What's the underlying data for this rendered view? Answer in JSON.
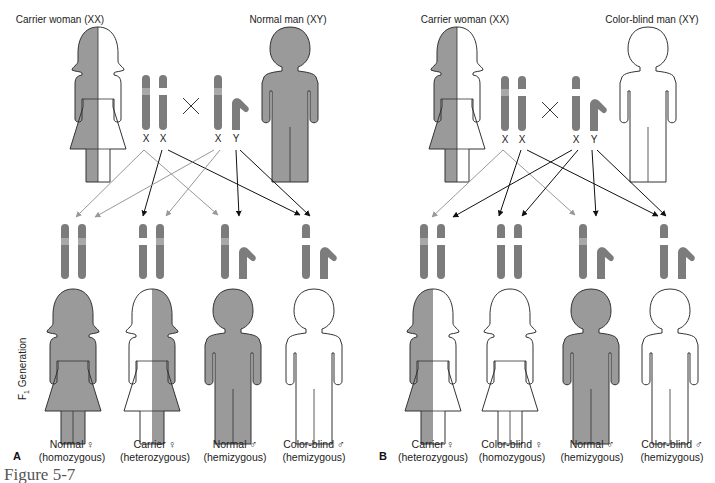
{
  "figure_label": "Figure 5-7",
  "colors": {
    "affected_fill": "#8a8a8a",
    "figure_fill": "#9a9a9a",
    "outline": "#333333",
    "gray_arrow": "#999999",
    "black_arrow": "#111111",
    "normal_band": "#a8a8a8",
    "mutant_band": "#ffffff"
  },
  "generation_label": "F",
  "generation_sub": "1",
  "generation_text": " Generation",
  "panels": [
    {
      "letter": "A",
      "parents": [
        {
          "title": "Carrier woman (XX)",
          "sex": "female",
          "fill": "half"
        },
        {
          "title": "Normal man (XY)",
          "sex": "male",
          "fill": "full"
        }
      ],
      "parent_chromosomes": {
        "mother": [
          "X",
          "X"
        ],
        "father": [
          "X",
          "Y"
        ],
        "cross_symbol": "×"
      },
      "offspring": [
        {
          "line1": "Normal ♀",
          "line2": "(homozygous)",
          "sex": "female",
          "fill": "full"
        },
        {
          "line1": "Carrier ♀",
          "line2": "(heterozygous)",
          "sex": "female",
          "fill": "half-right"
        },
        {
          "line1": "Normal ♂",
          "line2": "(hemizygous)",
          "sex": "male",
          "fill": "full"
        },
        {
          "line1": "Color-blind ♂",
          "line2": "(hemizygous)",
          "sex": "male",
          "fill": "none"
        }
      ]
    },
    {
      "letter": "B",
      "parents": [
        {
          "title": "Carrier woman (XX)",
          "sex": "female",
          "fill": "half"
        },
        {
          "title": "Color-blind man (XY)",
          "sex": "male",
          "fill": "none"
        }
      ],
      "parent_chromosomes": {
        "mother": [
          "X",
          "X"
        ],
        "father": [
          "X",
          "Y"
        ],
        "cross_symbol": "×"
      },
      "offspring": [
        {
          "line1": "Carrier ♀",
          "line2": "(heterozygous)",
          "sex": "female",
          "fill": "half"
        },
        {
          "line1": "Color-blind ♀",
          "line2": "(homozygous)",
          "sex": "female",
          "fill": "none"
        },
        {
          "line1": "Normal ♂",
          "line2": "(hemizygous)",
          "sex": "male",
          "fill": "full"
        },
        {
          "line1": "Color-blind ♂",
          "line2": "(hemizygous)",
          "sex": "male",
          "fill": "none"
        }
      ]
    }
  ]
}
